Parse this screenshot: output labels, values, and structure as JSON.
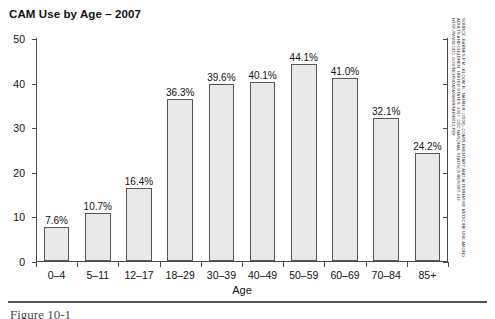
{
  "chart_data": {
    "type": "bar",
    "title": "CAM Use by Age – 2007",
    "xlabel": "Age",
    "ylabel": "",
    "ylim": [
      0,
      50
    ],
    "yticks": [
      0,
      10,
      20,
      30,
      40,
      50
    ],
    "grid": false,
    "legend": null,
    "value_suffix": "%",
    "categories": [
      "0–4",
      "5–11",
      "12–17",
      "18–29",
      "30–39",
      "40–49",
      "50–59",
      "60–69",
      "70–84",
      "85+"
    ],
    "values": [
      7.6,
      10.7,
      16.4,
      36.3,
      39.6,
      40.1,
      44.1,
      41.0,
      32.1,
      24.2
    ],
    "value_labels": [
      "7.6%",
      "10.7%",
      "16.4%",
      "36.3%",
      "39.6%",
      "40.1%",
      "44.1%",
      "41.0%",
      "32.1%",
      "24.2%"
    ],
    "bar_fill_color": "#e9e9e9",
    "bar_border_color": "#555555",
    "axis_color": "#4a4a4a"
  },
  "annotations": {
    "source_note": "SOURCE: BARNES P.M., BLOOM B., NAHIN R. (2008). COMPLEMENTARY AND ALTERNATIVE MEDICINE USE AMONG ADULTS AND CHILDREN: UNITED STATES, 2007. CDC NATIONAL STATISCS REPORT #12: HTTP://WWW.CDC.GOV/NCHS/DATA/NHSR/NHSR012.PDF",
    "figure_caption": "Figure 10-1"
  }
}
